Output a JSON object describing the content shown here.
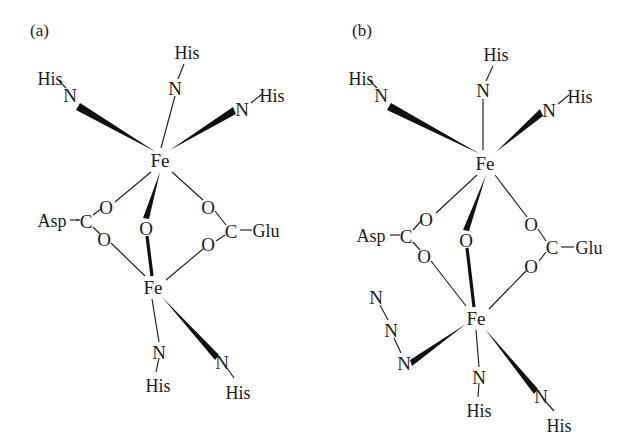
{
  "figure": {
    "type": "chemical-structure-diagram",
    "background_color": "#ffffff",
    "ink_color": "#1a1a1a",
    "width": 637,
    "height": 444
  },
  "panels": [
    {
      "id": "a",
      "label": "(a)",
      "label_pos": {
        "x": 30,
        "y": 36
      },
      "description": "Resting diiron center with mu-oxo bridge, bridging Asp and Glu carboxylates, four histidine nitrogen ligands",
      "metals": [
        {
          "name": "Fe",
          "label": "Fe",
          "x": 160,
          "y": 160,
          "role": "upper-iron"
        },
        {
          "name": "Fe",
          "label": "Fe",
          "x": 153,
          "y": 287,
          "role": "lower-iron"
        }
      ],
      "bridge_oxo": {
        "label": "O",
        "x": 146,
        "y": 228
      },
      "residues": [
        {
          "label": "Asp",
          "x": 52,
          "y": 220,
          "anchor": "middle"
        },
        {
          "label": "Glu",
          "x": 266,
          "y": 230,
          "anchor": "middle"
        }
      ],
      "carboxylate_carbons": [
        {
          "label": "C",
          "x": 86,
          "y": 221,
          "side": "asp"
        },
        {
          "label": "C",
          "x": 231,
          "y": 231,
          "side": "glu"
        }
      ],
      "carboxylate_oxygens": [
        {
          "label": "O",
          "x": 106,
          "y": 207,
          "side": "asp-upper"
        },
        {
          "label": "O",
          "x": 104,
          "y": 239,
          "side": "asp-lower"
        },
        {
          "label": "O",
          "x": 208,
          "y": 207,
          "side": "glu-upper"
        },
        {
          "label": "O",
          "x": 208,
          "y": 244,
          "side": "glu-lower"
        }
      ],
      "nitrogens": [
        {
          "label": "N",
          "x": 70,
          "y": 95,
          "bond": "wedge",
          "site": "upper-left"
        },
        {
          "label": "N",
          "x": 175,
          "y": 88,
          "bond": "thin",
          "site": "upper-center"
        },
        {
          "label": "N",
          "x": 242,
          "y": 109,
          "bond": "wedge",
          "site": "upper-right"
        },
        {
          "label": "N",
          "x": 159,
          "y": 352,
          "bond": "thin",
          "site": "lower-center"
        },
        {
          "label": "N",
          "x": 222,
          "y": 362,
          "bond": "wedge",
          "site": "lower-right"
        }
      ],
      "histidines": [
        {
          "label": "His",
          "x": 50,
          "y": 78,
          "site": "upper-left"
        },
        {
          "label": "His",
          "x": 187,
          "y": 52,
          "site": "upper-center"
        },
        {
          "label": "His",
          "x": 272,
          "y": 95,
          "site": "upper-right"
        },
        {
          "label": "His",
          "x": 158,
          "y": 385,
          "site": "lower-center"
        },
        {
          "label": "His",
          "x": 238,
          "y": 392,
          "site": "lower-right"
        }
      ]
    },
    {
      "id": "b",
      "label": "(b)",
      "label_pos": {
        "x": 352,
        "y": 36
      },
      "description": "Azide-bound diiron center; azide N3 coordinates the lower iron in place of one open site",
      "metals": [
        {
          "name": "Fe",
          "label": "Fe",
          "x": 485,
          "y": 163,
          "role": "upper-iron"
        },
        {
          "name": "Fe",
          "label": "Fe",
          "x": 476,
          "y": 318,
          "role": "lower-iron"
        }
      ],
      "bridge_oxo": {
        "label": "O",
        "x": 466,
        "y": 240
      },
      "residues": [
        {
          "label": "Asp",
          "x": 371,
          "y": 235,
          "anchor": "middle"
        },
        {
          "label": "Glu",
          "x": 589,
          "y": 247,
          "anchor": "middle"
        }
      ],
      "carboxylate_carbons": [
        {
          "label": "C",
          "x": 406,
          "y": 236,
          "side": "asp"
        },
        {
          "label": "C",
          "x": 552,
          "y": 247,
          "side": "glu"
        }
      ],
      "carboxylate_oxygens": [
        {
          "label": "O",
          "x": 426,
          "y": 219,
          "side": "asp-upper"
        },
        {
          "label": "O",
          "x": 424,
          "y": 256,
          "side": "asp-lower"
        },
        {
          "label": "O",
          "x": 531,
          "y": 224,
          "side": "glu-upper"
        },
        {
          "label": "O",
          "x": 531,
          "y": 266,
          "side": "glu-lower"
        }
      ],
      "nitrogens": [
        {
          "label": "N",
          "x": 381,
          "y": 95,
          "bond": "wedge",
          "site": "upper-left"
        },
        {
          "label": "N",
          "x": 483,
          "y": 90,
          "bond": "thin",
          "site": "upper-center"
        },
        {
          "label": "N",
          "x": 549,
          "y": 110,
          "bond": "wedge",
          "site": "upper-right"
        },
        {
          "label": "N",
          "x": 479,
          "y": 377,
          "bond": "thin",
          "site": "lower-center"
        },
        {
          "label": "N",
          "x": 541,
          "y": 396,
          "bond": "wedge",
          "site": "lower-right"
        }
      ],
      "histidines": [
        {
          "label": "His",
          "x": 361,
          "y": 78,
          "site": "upper-left"
        },
        {
          "label": "His",
          "x": 496,
          "y": 54,
          "site": "upper-center"
        },
        {
          "label": "His",
          "x": 580,
          "y": 96,
          "site": "upper-right"
        },
        {
          "label": "His",
          "x": 479,
          "y": 410,
          "site": "lower-center"
        },
        {
          "label": "His",
          "x": 559,
          "y": 425,
          "site": "lower-right"
        }
      ],
      "azide": {
        "name": "azide-ligand",
        "formula": "N3",
        "atoms": [
          {
            "label": "N",
            "x": 376,
            "y": 297,
            "position": "terminal"
          },
          {
            "label": "N",
            "x": 391,
            "y": 330,
            "position": "central"
          },
          {
            "label": "N",
            "x": 404,
            "y": 363,
            "position": "coordinating"
          }
        ]
      }
    }
  ]
}
